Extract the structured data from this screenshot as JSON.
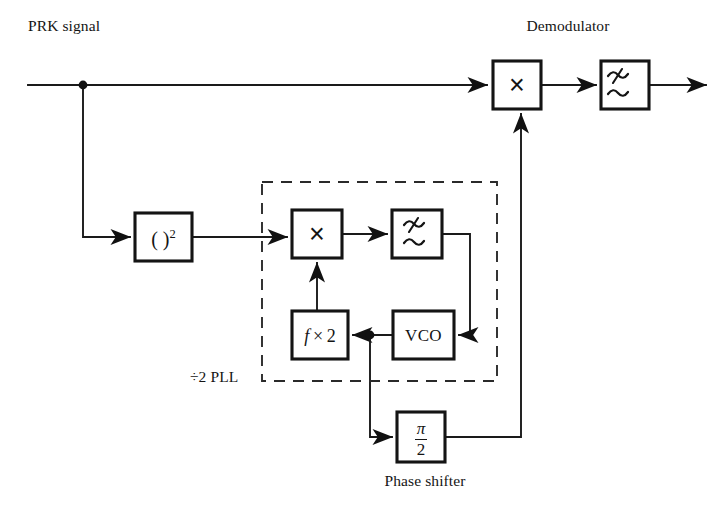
{
  "diagram": {
    "captions": {
      "input_label": "PRK signal",
      "demodulator_label": "Demodulator",
      "pll_label": "÷2 PLL",
      "phase_shifter_label": "Phase shifter"
    },
    "blocks": [
      {
        "id": "squarer",
        "name": "squaring-block",
        "text": "( )",
        "exponent": "2",
        "kind": "square-law-device",
        "x": 135,
        "y": 213,
        "w": 57,
        "h": 48
      },
      {
        "id": "pll-multiplier",
        "name": "pll-multiplier-block",
        "text": "×",
        "kind": "multiplier",
        "x": 292,
        "y": 210,
        "w": 50,
        "h": 48
      },
      {
        "id": "pll-filter",
        "name": "pll-loop-filter-block",
        "text": "≂",
        "kind": "lowpass-filter",
        "x": 392,
        "y": 210,
        "w": 50,
        "h": 48
      },
      {
        "id": "freq-doubler",
        "name": "frequency-multiplier-block",
        "text": "f × 2",
        "kind": "frequency-multiplier",
        "x": 292,
        "y": 311,
        "w": 56,
        "h": 48
      },
      {
        "id": "vco",
        "name": "vco-block",
        "text": "VCO",
        "kind": "voltage-controlled-oscillator",
        "x": 393,
        "y": 311,
        "w": 61,
        "h": 48
      },
      {
        "id": "demod-multiplier",
        "name": "demodulator-multiplier-block",
        "text": "×",
        "kind": "multiplier",
        "x": 493,
        "y": 61,
        "w": 48,
        "h": 48
      },
      {
        "id": "demod-filter",
        "name": "demodulator-lowpass-filter-block",
        "text": "≂",
        "kind": "lowpass-filter",
        "x": 601,
        "y": 61,
        "w": 48,
        "h": 48
      },
      {
        "id": "phase-shifter",
        "name": "phase-shifter-block",
        "numerator": "π",
        "denominator": "2",
        "kind": "phase-shifter",
        "x": 397,
        "y": 412,
        "w": 48,
        "h": 50
      }
    ],
    "junction_dots": [
      {
        "name": "input-split-junction",
        "x": 83,
        "y": 85
      },
      {
        "name": "vco-output-junction",
        "x": 370,
        "y": 335
      }
    ],
    "colors": {
      "line": "#1a1a1a",
      "box_border": "#141414",
      "background": "#ffffff",
      "dashed_border": "#2a2a2a"
    }
  }
}
